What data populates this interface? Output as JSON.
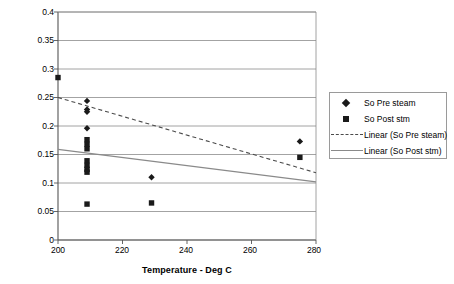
{
  "chart_data": {
    "type": "scatter",
    "title": "",
    "xlabel": "Temperature - Deg C",
    "ylabel": "Oil Saturation - Fraction",
    "xlim": [
      200,
      280
    ],
    "ylim": [
      0,
      0.4
    ],
    "xticks": [
      "200",
      "220",
      "240",
      "260",
      "280"
    ],
    "yticks": [
      "0",
      "0.05",
      "0.1",
      "0.15",
      "0.2",
      "0.25",
      "0.3",
      "0.35",
      "0.4"
    ],
    "grid": "horizontal",
    "legend_position": "right",
    "series": [
      {
        "name": "So Pre steam",
        "marker": "diamond",
        "color": "#1a1a1a",
        "points": [
          {
            "x": 209,
            "y": 0.244
          },
          {
            "x": 209,
            "y": 0.229
          },
          {
            "x": 209,
            "y": 0.225
          },
          {
            "x": 209,
            "y": 0.196
          },
          {
            "x": 229,
            "y": 0.11
          },
          {
            "x": 275,
            "y": 0.173
          }
        ]
      },
      {
        "name": "So Post stm",
        "marker": "square",
        "color": "#1a1a1a",
        "points": [
          {
            "x": 200,
            "y": 0.285
          },
          {
            "x": 209,
            "y": 0.176
          },
          {
            "x": 209,
            "y": 0.168
          },
          {
            "x": 209,
            "y": 0.16
          },
          {
            "x": 209,
            "y": 0.139
          },
          {
            "x": 209,
            "y": 0.131
          },
          {
            "x": 209,
            "y": 0.124
          },
          {
            "x": 209,
            "y": 0.119
          },
          {
            "x": 209,
            "y": 0.063
          },
          {
            "x": 229,
            "y": 0.065
          },
          {
            "x": 275,
            "y": 0.145
          }
        ]
      }
    ],
    "trendlines": [
      {
        "name": "Linear (So Pre steam)",
        "style": "dashed",
        "color": "#4a4a4a",
        "x0": 200,
        "y0": 0.25,
        "x1": 280,
        "y1": 0.118
      },
      {
        "name": "Linear (So Post stm)",
        "style": "solid",
        "color": "#8a8a8a",
        "x0": 200,
        "y0": 0.159,
        "x1": 280,
        "y1": 0.102
      }
    ]
  },
  "legend": {
    "items": [
      {
        "label": "So Pre steam",
        "key": "diamond-marker-icon"
      },
      {
        "label": "So Post stm",
        "key": "square-marker-icon"
      },
      {
        "label": "Linear (So Pre steam)",
        "key": "dashed-line-icon"
      },
      {
        "label": "Linear (So Post stm)",
        "key": "solid-line-icon"
      }
    ]
  },
  "colors": {
    "marker": "#1a1a1a",
    "trend_pre": "#4a4a4a",
    "trend_post": "#8a8a8a",
    "grid": "#8c8c8c",
    "axis": "#555555",
    "background": "#ffffff"
  }
}
